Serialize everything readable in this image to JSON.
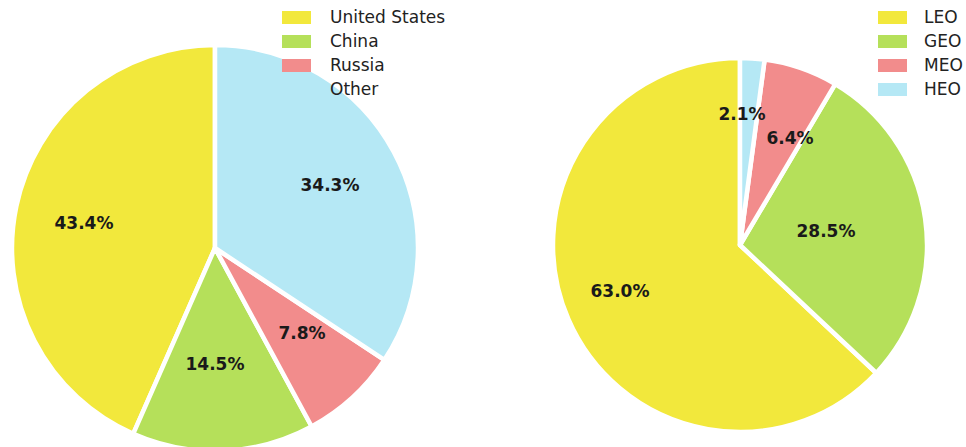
{
  "figure": {
    "background_color": "#ffffff",
    "width": 966,
    "height": 447
  },
  "palette": {
    "yellow": "#F2E83C",
    "green": "#B5E05A",
    "red": "#F28C8C",
    "cyan": "#B5E8F5",
    "label_text": "#1a1a1a",
    "legend_text": "#222222",
    "wedge_gap": "#ffffff"
  },
  "chart_data": [
    {
      "type": "pie",
      "id": "satellites-by-country",
      "title": "",
      "legend_position": "top-right",
      "start_angle_deg": 90,
      "direction": "counterclockwise",
      "center": [
        215,
        248
      ],
      "radius": 203,
      "categories": [
        "United States",
        "China",
        "Russia",
        "Other"
      ],
      "values": [
        43.4,
        14.5,
        7.8,
        34.3
      ],
      "labels": [
        "43.4%",
        "14.5%",
        "7.8%",
        "34.3%"
      ],
      "colors": [
        "#F2E83C",
        "#B5E05A",
        "#F28C8C",
        "#B5E8F5"
      ],
      "label_positions": [
        [
          84,
          224
        ],
        [
          215,
          365
        ],
        [
          302,
          334
        ],
        [
          330,
          186
        ]
      ]
    },
    {
      "type": "pie",
      "id": "satellites-by-orbit",
      "title": "",
      "legend_position": "top-right",
      "start_angle_deg": 90,
      "direction": "counterclockwise",
      "center": [
        257,
        245
      ],
      "radius": 187,
      "categories": [
        "LEO",
        "GEO",
        "MEO",
        "HEO"
      ],
      "values": [
        63.0,
        28.5,
        6.4,
        2.1
      ],
      "labels": [
        "63.0%",
        "28.5%",
        "6.4%",
        "2.1%"
      ],
      "colors": [
        "#F2E83C",
        "#B5E05A",
        "#F28C8C",
        "#B5E8F5"
      ],
      "label_positions": [
        [
          137,
          292
        ],
        [
          343,
          232
        ],
        [
          307,
          139
        ],
        [
          259,
          115
        ]
      ]
    }
  ],
  "legends": {
    "left": {
      "name": "country-legend",
      "items": [
        {
          "label": "United States",
          "color": "#F2E83C"
        },
        {
          "label": "China",
          "color": "#B5E05A"
        },
        {
          "label": "Russia",
          "color": "#F28C8C"
        },
        {
          "label": "Other",
          "color": "#B5E8F5"
        }
      ]
    },
    "right": {
      "name": "orbit-legend",
      "items": [
        {
          "label": "LEO",
          "color": "#F2E83C"
        },
        {
          "label": "GEO",
          "color": "#B5E05A"
        },
        {
          "label": "MEO",
          "color": "#F28C8C"
        },
        {
          "label": "HEO",
          "color": "#B5E8F5"
        }
      ]
    }
  }
}
